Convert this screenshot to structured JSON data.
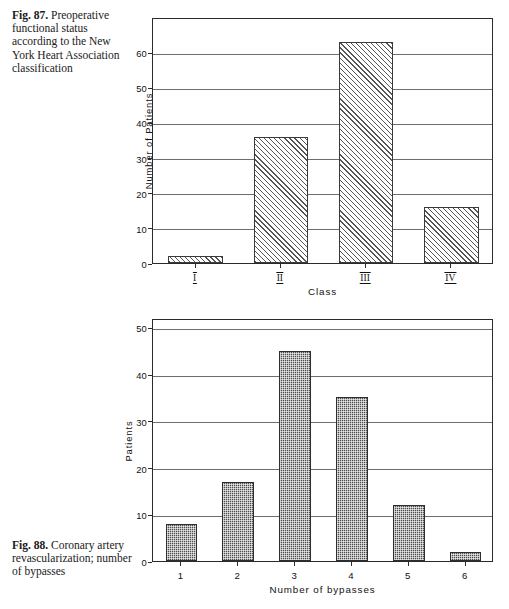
{
  "page": {
    "background": "#ffffff",
    "ink": "#000000"
  },
  "figures": [
    {
      "id": "fig-87",
      "number": "Fig. 87.",
      "caption": "Preoperative functional status according to the New York Heart Association classification",
      "chart_data": {
        "type": "bar",
        "title": "",
        "categories": [
          "I",
          "II",
          "III",
          "IV"
        ],
        "values": [
          2,
          36,
          63,
          16
        ],
        "xlabel": "Class",
        "ylabel": "Number of Patients",
        "ylim": [
          0,
          70
        ],
        "yticks": [
          0,
          10,
          20,
          30,
          40,
          50,
          60
        ],
        "grid": true,
        "legend": "none",
        "bar_fill": "diagonal-hatch"
      }
    },
    {
      "id": "fig-88",
      "number": "Fig. 88.",
      "caption": "Coronary artery revascularization; number of bypasses",
      "chart_data": {
        "type": "bar",
        "title": "",
        "categories": [
          "1",
          "2",
          "3",
          "4",
          "5",
          "6"
        ],
        "values": [
          8,
          17,
          45,
          35,
          12,
          2
        ],
        "xlabel": "Number of bypasses",
        "ylabel": "Patients",
        "ylim": [
          0,
          52
        ],
        "yticks": [
          0,
          10,
          20,
          30,
          40,
          50
        ],
        "grid": true,
        "legend": "none",
        "bar_fill": "stipple"
      }
    }
  ]
}
